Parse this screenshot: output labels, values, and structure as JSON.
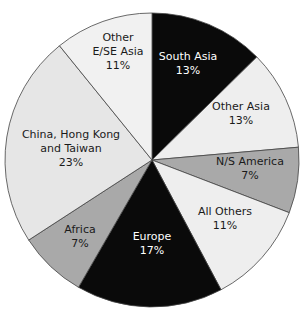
{
  "chart_data": {
    "type": "pie",
    "title": "",
    "start_angle_deg": 0,
    "direction": "clockwise",
    "slices": [
      {
        "label": "South Asia",
        "lines": [
          "South Asia",
          "13%"
        ],
        "value": 13,
        "color": "#0a0a0a",
        "text_color": "#ffffff",
        "start": 0,
        "end": 45.5,
        "lx": 188,
        "ly": 63
      },
      {
        "label": "Other Asia",
        "lines": [
          "Other Asia",
          "13%"
        ],
        "value": 13,
        "color": "#eeeeee",
        "text_color": "#1a1a1a",
        "start": 45.5,
        "end": 85,
        "lx": 241,
        "ly": 113
      },
      {
        "label": "N/S America",
        "lines": [
          "N/S America",
          "7%"
        ],
        "value": 7,
        "color": "#a9a9a9",
        "text_color": "#1a1a1a",
        "start": 85,
        "end": 111,
        "lx": 250,
        "ly": 168
      },
      {
        "label": "All Others",
        "lines": [
          "All Others",
          "11%"
        ],
        "value": 11,
        "color": "#eeeeee",
        "text_color": "#1a1a1a",
        "start": 111,
        "end": 152,
        "lx": 225,
        "ly": 218
      },
      {
        "label": "Europe",
        "lines": [
          "Europe",
          "17%"
        ],
        "value": 17,
        "color": "#0a0a0a",
        "text_color": "#ffffff",
        "start": 152,
        "end": 210,
        "lx": 152,
        "ly": 243
      },
      {
        "label": "Africa",
        "lines": [
          "Africa",
          "7%"
        ],
        "value": 7,
        "color": "#a9a9a9",
        "text_color": "#1a1a1a",
        "start": 210,
        "end": 237,
        "lx": 80,
        "ly": 236
      },
      {
        "label": "China, Hong Kong and Taiwan",
        "lines": [
          "China, Hong Kong",
          "and Taiwan",
          "23%"
        ],
        "value": 23,
        "color": "#e6e6e6",
        "text_color": "#1a1a1a",
        "start": 237,
        "end": 321,
        "lx": 71,
        "ly": 148
      },
      {
        "label": "Other E/SE Asia",
        "lines": [
          "Other",
          "E/SE Asia",
          "11%"
        ],
        "value": 11,
        "color": "#f1f1f1",
        "text_color": "#1a1a1a",
        "start": 321,
        "end": 360,
        "lx": 118,
        "ly": 51
      }
    ],
    "center": [
      152,
      160
    ],
    "radius": 147,
    "legend": "none (labels inside slices)"
  }
}
